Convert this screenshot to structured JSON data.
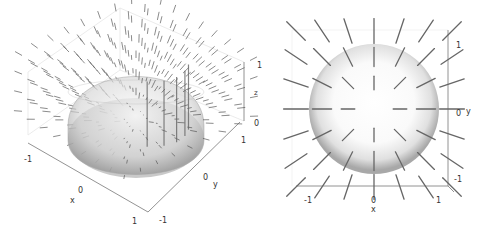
{
  "chart_data": [
    {
      "type": "quiver3d",
      "title": "",
      "description": "3D radial vector field around a translucent hemisphere of radius 1",
      "xlabel": "x",
      "ylabel": "y",
      "zlabel": "z",
      "xlim": [
        -1.2,
        1.2
      ],
      "ylim": [
        -1.2,
        1.2
      ],
      "zlim": [
        0,
        1
      ],
      "xticks": [
        "-1",
        "0",
        "1"
      ],
      "yticks": [
        "-1",
        "0",
        "1"
      ],
      "zticks": [
        "0",
        "1"
      ],
      "surface": {
        "shape": "hemisphere",
        "radius": 1,
        "color": "#b0b0b0",
        "opacity": 0.5
      },
      "arrow_color": "#555555",
      "grid": false
    },
    {
      "type": "quiver2d",
      "title": "",
      "description": "Top-down (x-y) projection: radial segments around a shaded disk of radius 1",
      "xlabel": "x",
      "ylabel": "y",
      "xlim": [
        -1.2,
        1.2
      ],
      "ylim": [
        -1.2,
        1.2
      ],
      "xticks": [
        "-1",
        "0",
        "1"
      ],
      "yticks": [
        "-1",
        "0",
        "1"
      ],
      "surface": {
        "shape": "disk",
        "radius": 1,
        "color": "#c8c8c8"
      },
      "segment_color": "#666666",
      "grid_spacing": 0.4,
      "grid": false
    }
  ],
  "labels": {
    "left": {
      "x": "x",
      "y": "y",
      "z": "z",
      "x_ticks": [
        "-1",
        "0",
        "1"
      ],
      "y_ticks": [
        "1",
        "0",
        "-1"
      ],
      "z_ticks": [
        "1",
        "0"
      ]
    },
    "right": {
      "x": "x",
      "y": "y",
      "x_ticks": [
        "-1",
        "0",
        "1"
      ],
      "y_ticks": [
        "1",
        "0",
        "-1"
      ]
    }
  }
}
